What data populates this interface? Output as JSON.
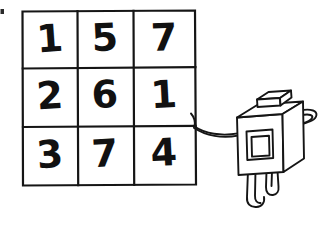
{
  "canvas": {
    "width": 335,
    "height": 229,
    "background_color": "#ffffff",
    "ink_color": "#111111",
    "style": "hand-drawn-sketch"
  },
  "grid": {
    "name": "3x3 number grid",
    "rows": 3,
    "columns": 3,
    "cells": [
      [
        "1",
        "5",
        "7"
      ],
      [
        "2",
        "6",
        "1"
      ],
      [
        "3",
        "7",
        "4"
      ]
    ],
    "row_1": {
      "c1": "1",
      "c2": "5",
      "c3": "7"
    },
    "row_2": {
      "c1": "2",
      "c2": "6",
      "c3": "1"
    },
    "row_3": {
      "c1": "3",
      "c2": "7",
      "c3": "4"
    }
  },
  "character": {
    "name": "box-robot",
    "description": "cube-bodied figure with a small block on its head, a square face window, two arms and two legs",
    "parts": {
      "head_block": "small-block",
      "face": "square-window",
      "left_arm": "arm-reaching-to-grid",
      "right_arm": "wavy-arm",
      "left_leg": "leg",
      "right_leg": "leg"
    }
  },
  "artifact": {
    "name": "stray-mark",
    "label": ""
  }
}
